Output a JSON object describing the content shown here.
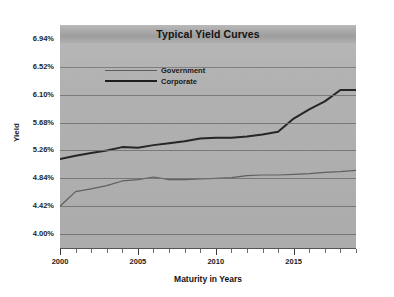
{
  "chart_data": {
    "type": "line",
    "title": "Typical Yield Curves",
    "xlabel": "Maturity in Years",
    "ylabel": "Yield",
    "grid": true,
    "legend_position": "upper-left-inside",
    "xlim": [
      2000,
      2019
    ],
    "ylim": [
      3.79,
      7.15
    ],
    "xticks": [
      2000,
      2005,
      2010,
      2015
    ],
    "xtick_labels": [
      "2000",
      "2005",
      "2010",
      "2015"
    ],
    "xticks_minor": [
      2001,
      2002,
      2003,
      2004,
      2006,
      2007,
      2008,
      2009,
      2011,
      2012,
      2013,
      2014,
      2016,
      2017,
      2018,
      2019
    ],
    "yticks": [
      4.0,
      4.42,
      4.84,
      5.26,
      5.68,
      6.1,
      6.52,
      6.94
    ],
    "ytick_labels": [
      "4.00%",
      "4.42%",
      "4.84%",
      "5.26%",
      "5.68%",
      "6.10%",
      "6.52%",
      "6.94%"
    ],
    "x": [
      2000,
      2001,
      2002,
      2003,
      2004,
      2005,
      2006,
      2007,
      2008,
      2009,
      2010,
      2011,
      2012,
      2013,
      2014,
      2015,
      2016,
      2017,
      2018,
      2019
    ],
    "series": [
      {
        "name": "Government",
        "color": "#5e5e5e",
        "width": 1.2,
        "values": [
          4.42,
          4.64,
          4.68,
          4.73,
          4.8,
          4.82,
          4.86,
          4.82,
          4.82,
          4.83,
          4.84,
          4.85,
          4.88,
          4.89,
          4.89,
          4.9,
          4.91,
          4.93,
          4.94,
          4.96
        ]
      },
      {
        "name": "Corporate",
        "color": "#1e1e1e",
        "width": 2.0,
        "values": [
          5.13,
          5.18,
          5.22,
          5.26,
          5.31,
          5.3,
          5.34,
          5.37,
          5.4,
          5.44,
          5.45,
          5.45,
          5.47,
          5.5,
          5.54,
          5.74,
          5.88,
          6.0,
          6.17,
          6.17
        ]
      }
    ]
  },
  "legend": {
    "items": [
      {
        "label": "Government"
      },
      {
        "label": "Corporate"
      }
    ]
  },
  "colors": {
    "plot_background": "#b4b4b4",
    "page_background": "#ffffff",
    "gridline": "#6f6f6f",
    "government_line": "#5e5e5e",
    "corporate_line": "#1e1e1e",
    "text": "#1a1a1a"
  }
}
